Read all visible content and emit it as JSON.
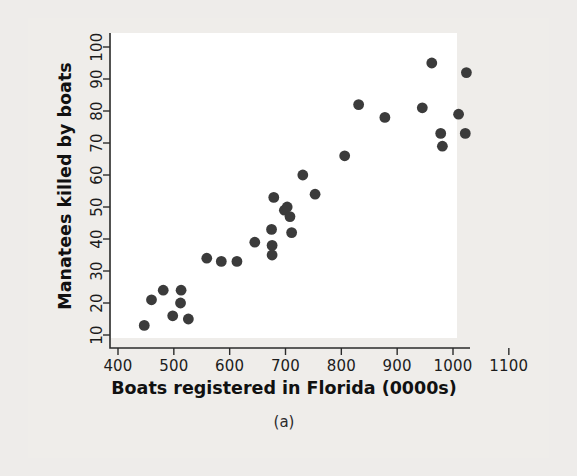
{
  "figure": {
    "caption": "(a)",
    "background_color": "#efedea",
    "plot_background_color": "#ffffff",
    "point_color": "#3b3b3b",
    "axis_color": "#2b2b2b"
  },
  "chart_data": {
    "type": "scatter",
    "title": "",
    "xlabel": "Boats registered in Florida (0000s)",
    "ylabel": "Manatees killed by boats",
    "xlim": [
      390,
      1130
    ],
    "ylim": [
      8,
      103
    ],
    "xticks": [
      400,
      500,
      600,
      700,
      800,
      900,
      1000,
      1100
    ],
    "xticklabels": [
      "400",
      "500",
      "600",
      "700",
      "800",
      "900",
      "1000",
      "1100"
    ],
    "yticks": [
      10,
      20,
      30,
      40,
      50,
      60,
      70,
      80,
      90,
      100
    ],
    "yticklabels": [
      "10",
      "20",
      "30",
      "40",
      "50",
      "60",
      "70",
      "80",
      "90",
      "100"
    ],
    "grid": false,
    "legend": false,
    "marker": "filled-circle",
    "marker_size": 5.4,
    "points": [
      {
        "x": 447,
        "y": 13
      },
      {
        "x": 460,
        "y": 21
      },
      {
        "x": 481,
        "y": 24
      },
      {
        "x": 498,
        "y": 16
      },
      {
        "x": 513,
        "y": 24
      },
      {
        "x": 512,
        "y": 20
      },
      {
        "x": 526,
        "y": 15
      },
      {
        "x": 559,
        "y": 34
      },
      {
        "x": 585,
        "y": 33
      },
      {
        "x": 613,
        "y": 33
      },
      {
        "x": 645,
        "y": 39
      },
      {
        "x": 675,
        "y": 43
      },
      {
        "x": 676,
        "y": 38
      },
      {
        "x": 676,
        "y": 35
      },
      {
        "x": 679,
        "y": 53
      },
      {
        "x": 698,
        "y": 49
      },
      {
        "x": 703,
        "y": 50
      },
      {
        "x": 708,
        "y": 47
      },
      {
        "x": 711,
        "y": 42
      },
      {
        "x": 731,
        "y": 60
      },
      {
        "x": 753,
        "y": 54
      },
      {
        "x": 806,
        "y": 66
      },
      {
        "x": 831,
        "y": 82
      },
      {
        "x": 878,
        "y": 78
      },
      {
        "x": 945,
        "y": 81
      },
      {
        "x": 962,
        "y": 95
      },
      {
        "x": 978,
        "y": 73
      },
      {
        "x": 981,
        "y": 69
      },
      {
        "x": 1010,
        "y": 79
      },
      {
        "x": 1024,
        "y": 92
      },
      {
        "x": 1022,
        "y": 73
      }
    ]
  }
}
